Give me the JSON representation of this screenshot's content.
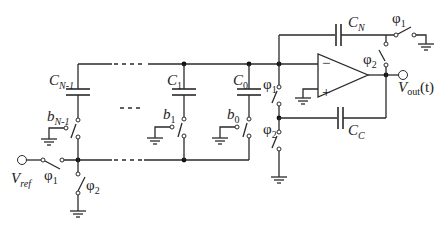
{
  "diagram": {
    "type": "switched-capacitor DAC / charge-redistribution circuit",
    "capacitors": {
      "c_n_minus_1": {
        "main": "C",
        "sub": "N-1"
      },
      "c1": {
        "main": "C",
        "sub": "1"
      },
      "c0": {
        "main": "C",
        "sub": "0"
      },
      "cn": {
        "main": "C",
        "sub": "N"
      },
      "cc": {
        "main": "C",
        "sub": "C"
      }
    },
    "bit_switches": {
      "b_n_minus_1": {
        "main": "b",
        "sub": "N-1"
      },
      "b1": {
        "main": "b",
        "sub": "1"
      },
      "b0": {
        "main": "b",
        "sub": "0"
      }
    },
    "phase_switches": {
      "phi1_vref": {
        "main": "φ",
        "sub": "1"
      },
      "phi2_bottom": {
        "main": "φ",
        "sub": "2"
      },
      "phi1_sum": {
        "main": "φ",
        "sub": "1"
      },
      "phi2_sum": {
        "main": "φ",
        "sub": "2"
      },
      "phi1_cn": {
        "main": "φ",
        "sub": "1"
      },
      "phi2_out": {
        "main": "φ",
        "sub": "2"
      }
    },
    "nodes": {
      "vref": {
        "main": "V",
        "sub": "ref"
      },
      "vout": {
        "main": "V",
        "sub": "out",
        "suffix": "(t)"
      }
    },
    "opamp": {
      "minus": "−",
      "plus": "+"
    },
    "ellipsis": "....",
    "colors": {
      "wire": "#2a2a2a",
      "background": "#ffffff"
    }
  }
}
